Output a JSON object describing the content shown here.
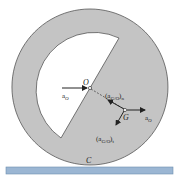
{
  "figure": {
    "labels": {
      "center": "O",
      "mass_center": "G",
      "contact": "C",
      "a_O_left": "a",
      "a_O_left_sub": "O",
      "a_O_right": "a",
      "a_O_right_sub": "O",
      "aGO_n": "(a",
      "aGO_n_sub": "G/O",
      "aGO_n_close": ")",
      "aGO_n_subscript2": "n",
      "aGO_t": "(a",
      "aGO_t_sub": "G/O",
      "aGO_t_close": ")",
      "aGO_t_subscript2": "t"
    },
    "colors": {
      "disk_fill": "#c4c4c4",
      "disk_stroke": "#555555",
      "ground": "#9bb6d3",
      "ground_edge": "#6f8fb0",
      "ink": "#222222"
    }
  }
}
